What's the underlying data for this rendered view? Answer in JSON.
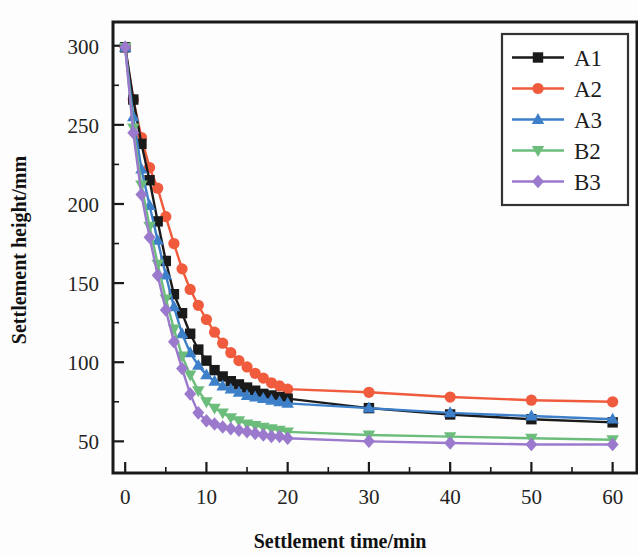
{
  "chart_data": {
    "type": "line",
    "title": "",
    "xlabel": "Settlement time/min",
    "ylabel": "Settlement height/mm",
    "xlim": [
      -1.5,
      63
    ],
    "ylim": [
      30,
      315
    ],
    "xticks": [
      0,
      10,
      20,
      30,
      40,
      50,
      60
    ],
    "yticks": [
      50,
      100,
      150,
      200,
      250,
      300
    ],
    "xtick_labels": [
      "0",
      "10",
      "20",
      "30",
      "40",
      "50",
      "60"
    ],
    "ytick_labels": [
      "50",
      "100",
      "150",
      "200",
      "250",
      "300"
    ],
    "x_minor_step": 5,
    "y_minor_step": 25,
    "grid": false,
    "legend_position": "top-right",
    "frame": true,
    "series": [
      {
        "name": "A1",
        "color": "#1a1a1a",
        "marker": "square",
        "x": [
          0,
          1,
          2,
          3,
          4,
          5,
          6,
          7,
          8,
          9,
          10,
          11,
          12,
          13,
          14,
          15,
          16,
          17,
          18,
          19,
          20,
          30,
          40,
          50,
          60
        ],
        "values": [
          299,
          266,
          238,
          215,
          189,
          164,
          143,
          131,
          118,
          108,
          101,
          95,
          91,
          88,
          86,
          84,
          82,
          80,
          79,
          78,
          77,
          71,
          67,
          64,
          62
        ]
      },
      {
        "name": "A2",
        "color": "#ef5b3c",
        "marker": "circle",
        "x": [
          0,
          1,
          2,
          3,
          4,
          5,
          6,
          7,
          8,
          9,
          10,
          11,
          12,
          13,
          14,
          15,
          16,
          17,
          18,
          19,
          20,
          30,
          40,
          50,
          60
        ],
        "values": [
          299,
          266,
          242,
          223,
          210,
          192,
          175,
          159,
          146,
          136,
          127,
          119,
          112,
          106,
          101,
          97,
          93,
          90,
          87,
          85,
          83,
          81,
          78,
          76,
          75
        ]
      },
      {
        "name": "A3",
        "color": "#3d80c9",
        "marker": "triangle-up",
        "x": [
          0,
          1,
          2,
          3,
          4,
          5,
          6,
          7,
          8,
          9,
          10,
          11,
          12,
          13,
          14,
          15,
          16,
          17,
          18,
          19,
          20,
          30,
          40,
          50,
          60
        ],
        "values": [
          299,
          255,
          222,
          199,
          177,
          155,
          135,
          118,
          106,
          98,
          92,
          88,
          85,
          83,
          81,
          79,
          78,
          77,
          76,
          75,
          74,
          71,
          68,
          66,
          64
        ]
      },
      {
        "name": "B2",
        "color": "#6cbd7c",
        "marker": "triangle-down",
        "x": [
          0,
          1,
          2,
          3,
          4,
          5,
          6,
          7,
          8,
          9,
          10,
          11,
          12,
          13,
          14,
          15,
          16,
          17,
          18,
          19,
          20,
          30,
          40,
          50,
          60
        ],
        "values": [
          299,
          248,
          212,
          186,
          162,
          140,
          121,
          104,
          92,
          82,
          75,
          71,
          68,
          65,
          63,
          61,
          60,
          59,
          58,
          57,
          56,
          54,
          53,
          52,
          51
        ]
      },
      {
        "name": "B3",
        "color": "#9b79cd",
        "marker": "diamond",
        "x": [
          0,
          1,
          2,
          3,
          4,
          5,
          6,
          7,
          8,
          9,
          10,
          11,
          12,
          13,
          14,
          15,
          16,
          17,
          18,
          19,
          20,
          30,
          40,
          50,
          60
        ],
        "values": [
          299,
          245,
          206,
          179,
          155,
          133,
          113,
          96,
          80,
          68,
          63,
          61,
          59,
          58,
          57,
          56,
          55,
          54,
          53,
          53,
          52,
          50,
          49,
          48,
          48
        ]
      }
    ]
  },
  "legend": {
    "entries": [
      {
        "label": "A1"
      },
      {
        "label": "A2"
      },
      {
        "label": "A3"
      },
      {
        "label": "B2"
      },
      {
        "label": "B3"
      }
    ]
  }
}
